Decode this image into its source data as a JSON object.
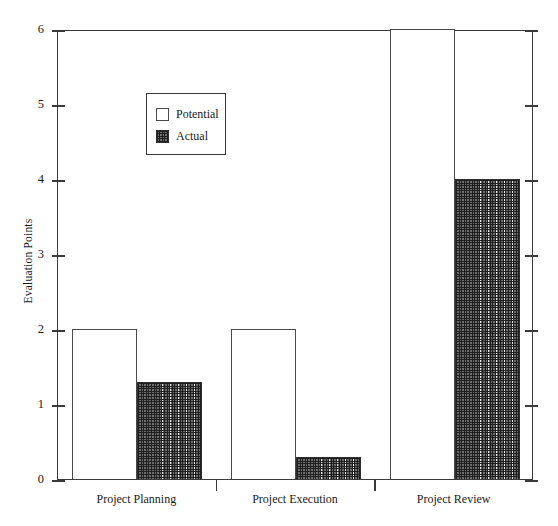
{
  "chart_data": {
    "type": "bar",
    "title": "",
    "xlabel": "",
    "ylabel": "Evaluation Points",
    "categories": [
      "Project Planning",
      "Project Execution",
      "Project Review"
    ],
    "series": [
      {
        "name": "Potential",
        "values": [
          2,
          2,
          6
        ]
      },
      {
        "name": "Actual",
        "values": [
          1.3,
          0.3,
          4
        ]
      }
    ],
    "ylim": [
      0,
      6
    ],
    "yticks": [
      0,
      1,
      2,
      3,
      4,
      5,
      6
    ],
    "ytick_labels": [
      "0",
      "1",
      "2",
      "3",
      "4",
      "5",
      "6"
    ],
    "grid": false,
    "legend_position": "upper-left-inside",
    "legend_entries": [
      "Potential",
      "Actual"
    ],
    "right_axis_ticks": true,
    "right_axis_labels": false,
    "colors": {
      "potential_fill": "#ffffff",
      "potential_edge": "#4a4a4a",
      "actual_fill": "#6e6e6e",
      "actual_hatch": "#1f1f1f",
      "actual_edge": "#2e2e2e",
      "axis": "#3a3a3a",
      "text": "#1a1a1a",
      "background": "#ffffff"
    }
  }
}
